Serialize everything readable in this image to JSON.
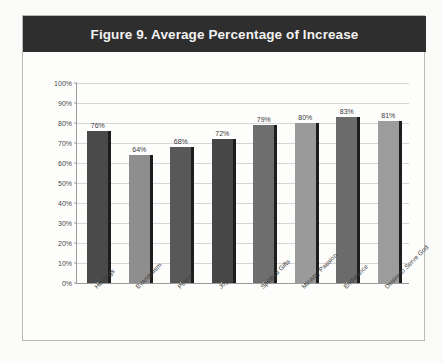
{
  "figure": {
    "title": "Figure 9. Average Percentage of Increase",
    "title_bar_color": "#2e2e2e",
    "title_text_color": "#f2f2f2",
    "frame_border_color": "#b9b9b9",
    "background_color": "#fdfdfc"
  },
  "chart_data": {
    "type": "bar",
    "title": "Figure 9. Average Percentage of Increase",
    "xlabel": "",
    "ylabel": "",
    "categories": [
      "Healings",
      "Evangelism",
      "Peace",
      "Joy",
      "Spiritual Gifts",
      "Ministry Passion",
      "Endurance",
      "Desire to Serve God"
    ],
    "values": [
      76,
      64,
      68,
      72,
      79,
      80,
      83,
      81
    ],
    "data_labels": [
      "76%",
      "64%",
      "68%",
      "72%",
      "79%",
      "80%",
      "83%",
      "81%"
    ],
    "bar_colors": [
      "#4a4a4a",
      "#8e8e8e",
      "#585858",
      "#474747",
      "#6e6e6e",
      "#9a9a9a",
      "#6b6b6b",
      "#9c9c9c"
    ],
    "bar_shadow_color": "#1d1d1d",
    "ylim": [
      0,
      100
    ],
    "ytick_values": [
      100,
      90,
      80,
      70,
      60,
      50,
      40,
      30,
      20,
      10,
      0
    ],
    "ytick_labels": [
      "100%",
      "90%",
      "80%",
      "70%",
      "60%",
      "50%",
      "40%",
      "30%",
      "20%",
      "10%",
      "0%"
    ],
    "grid": true,
    "gridline_color": "#d6d6d6",
    "axis_color": "#9a9a9a",
    "legend": false,
    "legend_position": "none",
    "xtick_label_rotation": -45
  }
}
